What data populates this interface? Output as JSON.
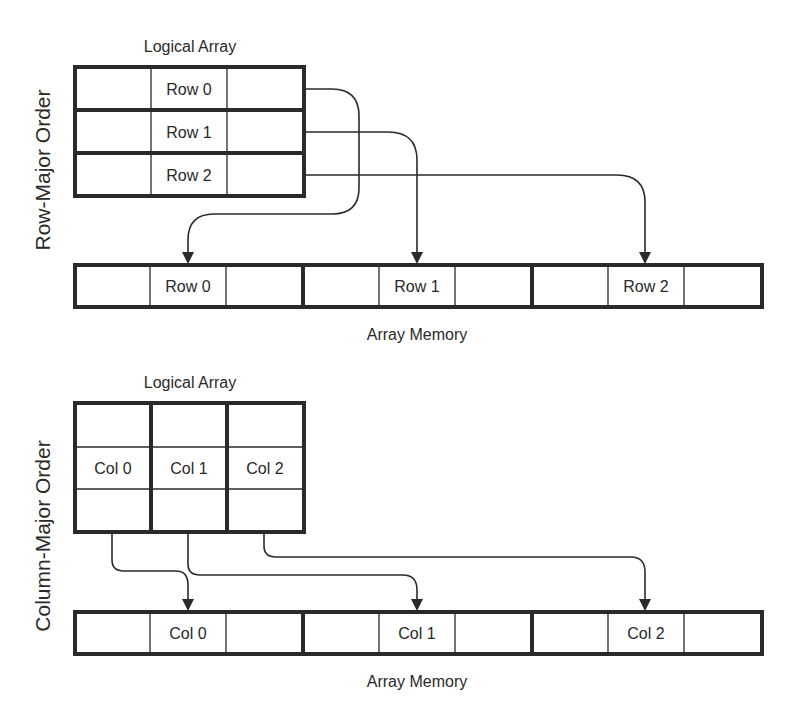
{
  "row_major": {
    "side_label": "Row-Major Order",
    "logical_title": "Logical Array",
    "logical_rows": [
      "Row 0",
      "Row 1",
      "Row 2"
    ],
    "memory_label": "Array Memory",
    "memory_cells": [
      "Row 0",
      "Row 1",
      "Row 2"
    ]
  },
  "column_major": {
    "side_label": "Column-Major Order",
    "logical_title": "Logical Array",
    "logical_cols": [
      "Col 0",
      "Col 1",
      "Col 2"
    ],
    "memory_label": "Array Memory",
    "memory_cells": [
      "Col 0",
      "Col 1",
      "Col 2"
    ]
  },
  "colors": {
    "ink": "#2a2a2a",
    "background": "#ffffff"
  }
}
